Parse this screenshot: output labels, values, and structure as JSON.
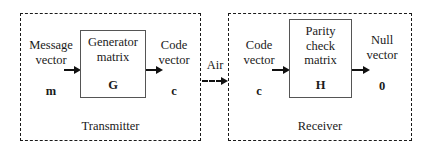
{
  "diagram": {
    "colors": {
      "stroke": "#1a1a1a",
      "inner_box_stroke": "#555555",
      "background": "#ffffff"
    },
    "transmitter": {
      "section_label": "Transmitter",
      "input": {
        "line1": "Message",
        "line2": "vector",
        "symbol": "m"
      },
      "block": {
        "line1": "Generator",
        "line2": "matrix",
        "symbol": "G"
      },
      "output": {
        "line1": "Code",
        "line2": "vector",
        "symbol": "c"
      }
    },
    "channel": {
      "label": "Air"
    },
    "receiver": {
      "section_label": "Receiver",
      "input": {
        "line1": "Code",
        "line2": "vector",
        "symbol": "c"
      },
      "block": {
        "line1": "Parity",
        "line2": "check",
        "line3": "matrix",
        "symbol": "H"
      },
      "output": {
        "line1": "Null",
        "line2": "vector",
        "symbol": "0"
      }
    }
  }
}
